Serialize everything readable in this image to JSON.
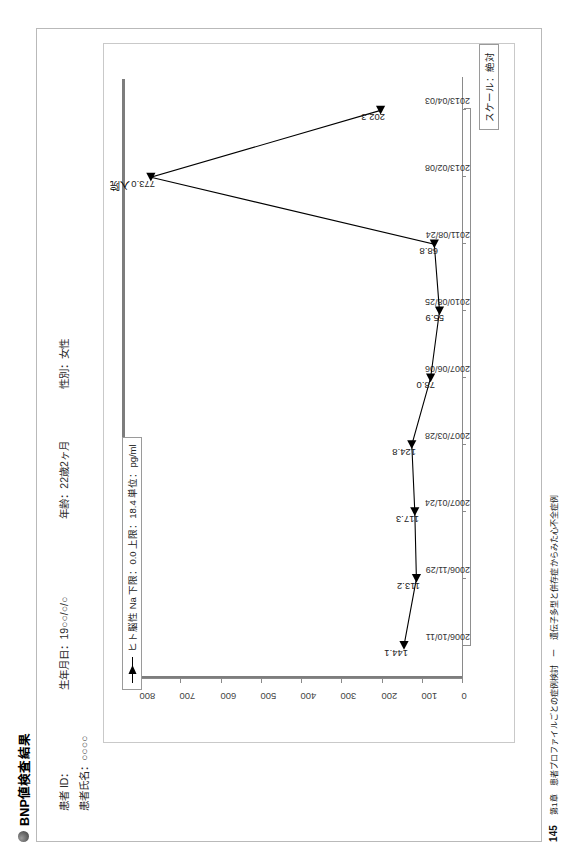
{
  "document": {
    "title": "BNP値検査結果",
    "bullet_icon": "filled-circle-bullet"
  },
  "patient": {
    "id_label": "患者 ID：",
    "id_value": "",
    "birth_label": "生年月日：",
    "birth_value": "19○○/○/○",
    "age_label": "年齢：",
    "age_value": "22歳2ヶ月",
    "sex_label": "性別：",
    "sex_value": "女性",
    "name_label": "患者氏名：",
    "name_value": "○○○○"
  },
  "legend": {
    "marker": "line-with-triangle-marker",
    "text": "ヒト脳性 Na 下限：0.0  上限：18.4  単位：pg/ml"
  },
  "axis_title": {
    "x": "スケール：絶対"
  },
  "annotation": {
    "admission": "入院"
  },
  "footer": {
    "page": "145",
    "text": "第1章　患者プロファイルごとの症例検討　ー　遺伝子多型と併存症からみた心不全症例"
  },
  "chart_data": {
    "type": "line",
    "title": "BNP値検査結果",
    "xlabel": "スケール：絶対",
    "ylabel": "",
    "ylim": [
      0,
      800
    ],
    "yticks": [
      0,
      100,
      200,
      300,
      400,
      500,
      600,
      700,
      800
    ],
    "grid": false,
    "legend_position": "top-left",
    "categories": [
      "2006/10/11",
      "2006/11/29",
      "2007/01/24",
      "2007/03/28",
      "2007/06/06",
      "2010/08/25",
      "2011/08/24",
      "2013/02/08",
      "2013/04/03"
    ],
    "series": [
      {
        "name": "ヒト脳性 Na",
        "unit": "pg/ml",
        "lower_limit": 0.0,
        "upper_limit": 18.4,
        "values": [
          144.1,
          113.2,
          117.3,
          124.8,
          78.0,
          55.9,
          68.8,
          773.0,
          202.3
        ]
      }
    ],
    "point_labels": [
      "144.1",
      "113.2",
      "117.3",
      "124.8",
      "78.0",
      "55.9",
      "68.8",
      "773.0",
      "202.3"
    ],
    "annotations": [
      {
        "text": "入院",
        "at_category": "2013/02/08",
        "value": 773.0
      }
    ]
  }
}
